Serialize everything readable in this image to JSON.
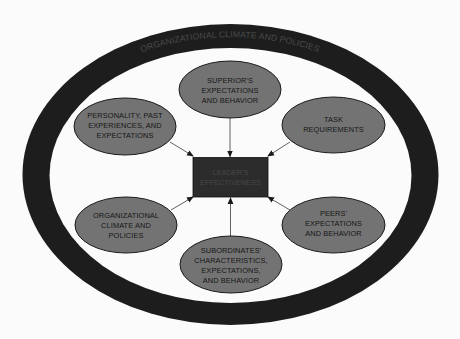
{
  "colors": {
    "background": "#fbfbfb",
    "ring": "#1d1d1d",
    "ellipse_fill": "#737373",
    "ellipse_stroke": "#1a1a1a",
    "center_box_fill": "#2c2c2c",
    "arrow": "#333333"
  },
  "ring": {
    "label": "ORGANIZATIONAL CLIMATE AND POLICIES"
  },
  "center": {
    "lines": [
      "LEADER'S",
      "EFFECTIVENESS"
    ]
  },
  "nodes": [
    {
      "id": "superior",
      "lines": [
        "SUPERIOR'S",
        "EXPECTATIONS",
        "AND BEHAVIOR"
      ]
    },
    {
      "id": "personality",
      "lines": [
        "PERSONALITY, PAST",
        "EXPERIENCES, AND",
        "EXPECTATIONS"
      ]
    },
    {
      "id": "task",
      "lines": [
        "TASK",
        "REQUIREMENTS"
      ]
    },
    {
      "id": "org-climate",
      "lines": [
        "ORGANIZATIONAL",
        "CLIMATE AND",
        "POLICIES"
      ]
    },
    {
      "id": "peers",
      "lines": [
        "PEERS'",
        "EXPECTATIONS",
        "AND BEHAVIOR"
      ]
    },
    {
      "id": "subordinates",
      "lines": [
        "SUBORDINATES'",
        "CHARACTERISTICS,",
        "EXPECTATIONS,",
        "AND BEHAVIOR"
      ]
    }
  ]
}
